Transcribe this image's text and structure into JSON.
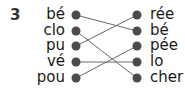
{
  "exercise": {
    "number": "3",
    "left_syllables": [
      "bé",
      "clo",
      "pu",
      "vé",
      "pou"
    ],
    "right_syllables": [
      "rée",
      "bé",
      "pée",
      "lo",
      "cher"
    ],
    "connections": [
      {
        "from": 0,
        "to": 1
      },
      {
        "from": 1,
        "to": 4
      },
      {
        "from": 2,
        "to": 0
      },
      {
        "from": 3,
        "to": 3
      },
      {
        "from": 4,
        "to": 2
      }
    ],
    "dot_color": "#4a4a4a",
    "line_color": "#6a6a6a"
  }
}
